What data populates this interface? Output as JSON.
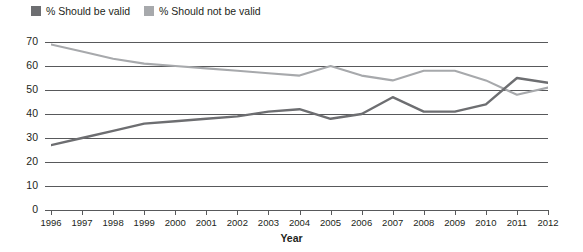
{
  "legend": {
    "position": "top-left",
    "entries": [
      {
        "label": "% Should be valid",
        "color": "#6d6e71",
        "name": "legend-should-be-valid"
      },
      {
        "label": "% Should not be valid",
        "color": "#a7a9ac",
        "name": "legend-should-not-be-valid"
      }
    ]
  },
  "axes": {
    "y_title": "Percent",
    "x_title": "Year",
    "y_ticks": [
      "0",
      "10",
      "20",
      "30",
      "40",
      "50",
      "60",
      "70"
    ],
    "x_ticks": [
      "1996",
      "1997",
      "1998",
      "1999",
      "2000",
      "2001",
      "2002",
      "2003",
      "2004",
      "2005",
      "2006",
      "2007",
      "2008",
      "2009",
      "2010",
      "2011",
      "2012"
    ]
  },
  "chart_data": {
    "type": "line",
    "title": "",
    "xlabel": "Year",
    "ylabel": "Percent",
    "x": [
      1996,
      1997,
      1998,
      1999,
      2000,
      2001,
      2002,
      2003,
      2004,
      2005,
      2006,
      2007,
      2008,
      2009,
      2010,
      2011,
      2012
    ],
    "categories": [
      "1996",
      "1997",
      "1998",
      "1999",
      "2000",
      "2001",
      "2002",
      "2003",
      "2004",
      "2005",
      "2006",
      "2007",
      "2008",
      "2009",
      "2010",
      "2011",
      "2012"
    ],
    "series": [
      {
        "name": "% Should be valid",
        "color": "#6d6e71",
        "values": [
          27,
          30,
          33,
          36,
          37,
          38,
          39,
          41,
          42,
          38,
          40,
          47,
          41,
          41,
          44,
          55,
          53
        ]
      },
      {
        "name": "% Should not be valid",
        "color": "#a7a9ac",
        "values": [
          69,
          66,
          63,
          61,
          60,
          59,
          58,
          57,
          56,
          60,
          56,
          54,
          58,
          58,
          54,
          48,
          51
        ]
      }
    ],
    "ylim": [
      0,
      70
    ],
    "xlim": [
      1996,
      2012
    ],
    "ytick_step": 10,
    "grid": true,
    "grid_axis": "y",
    "legend_position": "top-left"
  }
}
